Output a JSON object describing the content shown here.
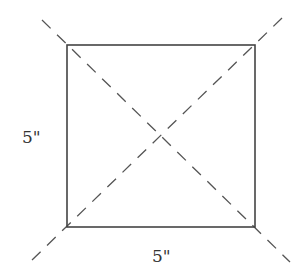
{
  "diagram": {
    "square": {
      "x1": 67,
      "y1": 45,
      "x2": 255,
      "y2": 227,
      "stroke": "#444444"
    },
    "diagonals": [
      {
        "x1": 42,
        "y1": 20,
        "x2": 290,
        "y2": 262
      },
      {
        "x1": 282,
        "y1": 18,
        "x2": 32,
        "y2": 260
      }
    ],
    "labels": {
      "left_side": "5\"",
      "bottom_side": "5\""
    },
    "dash_color": "#555555"
  }
}
